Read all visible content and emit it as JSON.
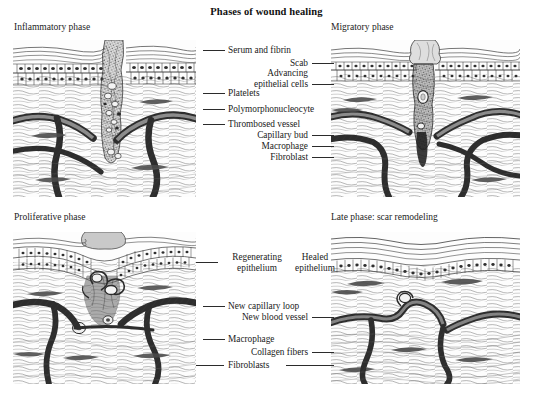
{
  "figure": {
    "title": "Phases of wound healing",
    "panels": [
      {
        "id": "inflammatory",
        "title": "Inflammatory phase"
      },
      {
        "id": "migratory",
        "title": "Migratory phase"
      },
      {
        "id": "proliferative",
        "title": "Proliferative phase"
      },
      {
        "id": "late",
        "title": "Late phase: scar remodeling"
      }
    ],
    "labels": {
      "serum_and_fibrin": "Serum and fibrin",
      "scab": "Scab",
      "advancing_epithelial_cells_line1": "Advancing",
      "advancing_epithelial_cells_line2": "epithelial cells",
      "platelets": "Platelets",
      "polymorphonucleocyte": "Polymorphonucleocyte",
      "thrombosed_vessel": "Thrombosed vessel",
      "capillary_bud": "Capillary bud",
      "macrophage_top": "Macrophage",
      "fibroblast": "Fibroblast",
      "regenerating_epithelium_line1": "Regenerating",
      "regenerating_epithelium_line2": "epithelium",
      "healed_epithelium_line1": "Healed",
      "healed_epithelium_line2": "epithelium",
      "new_capillary_loop": "New capillary loop",
      "new_blood_vessel": "New blood vessel",
      "macrophage_bottom": "Macrophage",
      "collagen_fibers": "Collagen fibers",
      "fibroblasts": "Fibroblasts"
    },
    "colors": {
      "ink": "#2b2b2b",
      "text": "#1a1a1a",
      "background": "#ffffff"
    }
  }
}
